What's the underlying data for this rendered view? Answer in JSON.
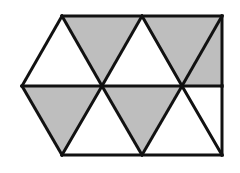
{
  "figure": {
    "name": "triangular-grid-parallelogram",
    "width": 240,
    "height": 173,
    "background_color": "#FFFFFF",
    "stroke_color": "#111111",
    "stroke_width": 3,
    "fill_gray": "#BEBEBE",
    "fill_white": "#FFFFFF",
    "triangle_count": 10,
    "gray_count": 5,
    "white_count": 5,
    "rows": 2,
    "columns": 5,
    "lattice": {
      "top_y": 16,
      "middle_y": 86,
      "bottom_y": 155,
      "top_x": [
        62,
        142,
        222
      ],
      "middle_x": [
        22,
        102,
        182
      ],
      "bottom_x": [
        62,
        142,
        222
      ],
      "cell_half_width": 40,
      "cell_height": 70
    },
    "triangles": [
      {
        "id": "t1",
        "row": "top",
        "index": 0,
        "orientation": "down",
        "fill": "white",
        "points": "22,86 62,16 102,86"
      },
      {
        "id": "t2",
        "row": "top",
        "index": 1,
        "orientation": "up",
        "fill": "gray",
        "points": "62,16 142,16 102,86"
      },
      {
        "id": "t3",
        "row": "top",
        "index": 2,
        "orientation": "down",
        "fill": "white",
        "points": "102,86 142,16 182,86"
      },
      {
        "id": "t4",
        "row": "top",
        "index": 3,
        "orientation": "up",
        "fill": "gray",
        "points": "142,16 222,16 182,86"
      },
      {
        "id": "t5",
        "row": "top",
        "index": 4,
        "orientation": "down",
        "fill": "gray",
        "points": "182,86 222,16 222,86"
      },
      {
        "id": "t6",
        "row": "bottom",
        "index": 0,
        "orientation": "down",
        "fill": "gray",
        "points": "22,86 102,86 62,155"
      },
      {
        "id": "t7",
        "row": "bottom",
        "index": 1,
        "orientation": "up",
        "fill": "white",
        "points": "62,155 102,86 142,155"
      },
      {
        "id": "t8",
        "row": "bottom",
        "index": 2,
        "orientation": "down",
        "fill": "gray",
        "points": "102,86 182,86 142,155"
      },
      {
        "id": "t9",
        "row": "bottom",
        "index": 3,
        "orientation": "up",
        "fill": "white",
        "points": "142,155 182,86 222,155"
      },
      {
        "id": "t10",
        "row": "bottom",
        "index": 4,
        "orientation": "down",
        "fill": "white",
        "points": "182,86 222,86 222,155"
      }
    ],
    "edges": [
      {
        "id": "e-top",
        "name": "top-edge",
        "points": "62,16 222,16"
      },
      {
        "id": "e-bottom",
        "name": "bottom-edge",
        "points": "62,155 222,155"
      },
      {
        "id": "e-middle",
        "name": "middle-horizontal",
        "points": "22,86 222,86"
      },
      {
        "id": "e-left-up",
        "name": "upper-left-edge",
        "points": "22,86 62,16"
      },
      {
        "id": "e-left-down",
        "name": "lower-left-edge",
        "points": "22,86 62,155"
      },
      {
        "id": "e-right-up",
        "name": "upper-right-edge",
        "points": "222,16 222,86"
      },
      {
        "id": "e-right-down",
        "name": "lower-right-edge",
        "points": "222,86 222,155"
      },
      {
        "id": "d1",
        "name": "diagonal-down-1",
        "points": "62,16 102,86"
      },
      {
        "id": "d2",
        "name": "diagonal-up-1",
        "points": "142,16 102,86"
      },
      {
        "id": "d3",
        "name": "diagonal-down-2",
        "points": "142,16 182,86"
      },
      {
        "id": "d4",
        "name": "diagonal-up-2",
        "points": "222,16 182,86"
      },
      {
        "id": "d5",
        "name": "diagonal-down-3",
        "points": "102,86 62,155"
      },
      {
        "id": "d6",
        "name": "diagonal-up-3",
        "points": "102,86 142,155"
      },
      {
        "id": "d7",
        "name": "diagonal-down-4",
        "points": "182,86 142,155"
      },
      {
        "id": "d8",
        "name": "diagonal-up-4",
        "points": "182,86 222,155"
      }
    ]
  }
}
